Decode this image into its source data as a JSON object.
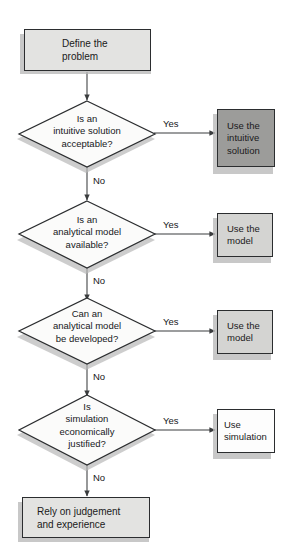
{
  "diagram": {
    "background_color": "#ffffff",
    "outline_color": "#2b2d2f",
    "colors": {
      "box_light_gray": "#e3e3e1",
      "box_mid_gray": "#d4d4d2",
      "box_dark_gray": "#9c9c9a",
      "box_white": "#fdfdfd",
      "diamond_fill": "#fbfbfa",
      "shadow": "#b9b9b9",
      "text": "#16181a"
    },
    "nodes": [
      {
        "id": "start",
        "type": "process",
        "label": "Define the\nproblem",
        "fill": "#e3e3e1"
      },
      {
        "id": "d1",
        "type": "decision",
        "label": "Is an\nintuitive solution\nacceptable?",
        "fill": "#fbfbfa"
      },
      {
        "id": "use_intuitive",
        "type": "process",
        "label": "Use the\nintuitive\nsolution",
        "fill": "#9c9c9a"
      },
      {
        "id": "d2",
        "type": "decision",
        "label": "Is an\nanalytical model\navailable?",
        "fill": "#fbfbfa"
      },
      {
        "id": "use_model_1",
        "type": "process",
        "label": "Use the\nmodel",
        "fill": "#d4d4d2"
      },
      {
        "id": "d3",
        "type": "decision",
        "label": "Can an\nanalytical model\nbe developed?",
        "fill": "#fbfbfa"
      },
      {
        "id": "use_model_2",
        "type": "process",
        "label": "Use the\nmodel",
        "fill": "#d4d4d2"
      },
      {
        "id": "d4",
        "type": "decision",
        "label": "Is\nsimulation\neconomically\njustified?",
        "fill": "#fbfbfa"
      },
      {
        "id": "use_sim",
        "type": "process",
        "label": "Use\nsimulation",
        "fill": "#fdfdfd"
      },
      {
        "id": "rely",
        "type": "process",
        "label": "Rely on judgement\nand experience",
        "fill": "#e3e3e1"
      }
    ],
    "edge_labels": {
      "yes_1": "Yes",
      "no_1": "No",
      "yes_2": "Yes",
      "no_2": "No",
      "yes_3": "Yes",
      "no_3": "No",
      "yes_4": "Yes",
      "no_4": "No"
    }
  }
}
